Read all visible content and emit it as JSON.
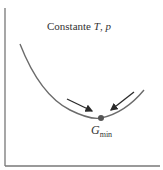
{
  "diagram": {
    "title_prefix": "Constante ",
    "title_var1": "T",
    "title_sep": ", ",
    "title_var2": "p",
    "min_label_main": "G",
    "min_label_sub": "min",
    "colors": {
      "axis": "#777777",
      "curve": "#6b6b6b",
      "arrow": "#2a2a2a",
      "point": "#555555",
      "text": "#333333"
    }
  }
}
